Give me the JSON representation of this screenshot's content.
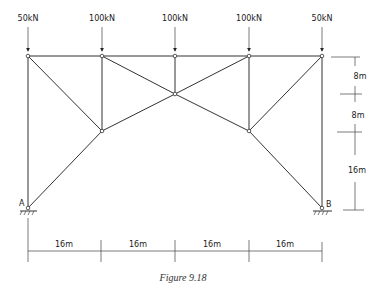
{
  "figure": {
    "caption": "Figure 9.18",
    "loads": [
      {
        "label": "50kN",
        "x": 28
      },
      {
        "label": "100kN",
        "x": 102
      },
      {
        "label": "100kN",
        "x": 175
      },
      {
        "label": "100kN",
        "x": 249
      },
      {
        "label": "50kN",
        "x": 322
      }
    ],
    "supports": [
      {
        "label": "A"
      },
      {
        "label": "B"
      }
    ],
    "horizontal_dimensions": [
      "16m",
      "16m",
      "16m",
      "16m"
    ],
    "vertical_dimensions": [
      "8m",
      "8m",
      "16m"
    ],
    "colors": {
      "line": "#333333",
      "background": "#ffffff"
    }
  }
}
